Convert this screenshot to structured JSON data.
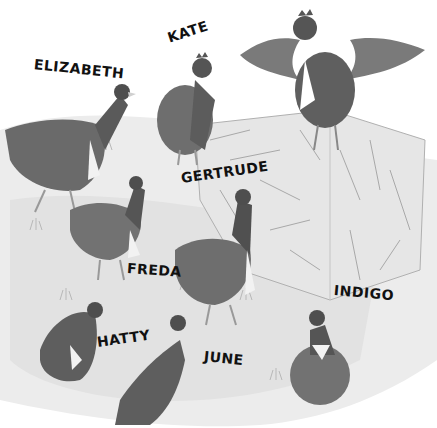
{
  "illustration": {
    "description": "Grayscale watercolor illustration of hens in a farmyard near a hay bale, each labeled with a name",
    "palette": {
      "background": "#ffffff",
      "grass": "#d9d9d9",
      "hay": "#e4e4e4",
      "hay_stroke": "#a8a8a8",
      "hen_dark": "#4a4a4a",
      "hen_mid": "#6e6e6e",
      "hen_light": "#9a9a9a",
      "label": "#111111"
    },
    "labels": [
      {
        "name": "ELIZABETH",
        "x": 34,
        "y": 56,
        "rotate": 6
      },
      {
        "name": "KATE",
        "x": 168,
        "y": 28,
        "rotate": -18
      },
      {
        "name": "GERTRUDE",
        "x": 181,
        "y": 168,
        "rotate": -8
      },
      {
        "name": "FREDA",
        "x": 127,
        "y": 262,
        "rotate": 4
      },
      {
        "name": "INDIGO",
        "x": 334,
        "y": 284,
        "rotate": 5
      },
      {
        "name": "HATTY",
        "x": 97,
        "y": 334,
        "rotate": -8
      },
      {
        "name": "JUNE",
        "x": 204,
        "y": 350,
        "rotate": 6
      }
    ],
    "hens": [
      {
        "id": "elizabeth",
        "pose": "walking, head up"
      },
      {
        "id": "kate",
        "pose": "standing, facing right"
      },
      {
        "id": "rooster-on-hay",
        "pose": "wings spread atop hay bale"
      },
      {
        "id": "gertrude",
        "pose": "looking up"
      },
      {
        "id": "freda",
        "pose": "standing"
      },
      {
        "id": "hatty",
        "pose": "partially visible at left"
      },
      {
        "id": "june",
        "pose": "head and neck visible"
      },
      {
        "id": "indigo",
        "pose": "fluffed, facing left"
      }
    ]
  }
}
